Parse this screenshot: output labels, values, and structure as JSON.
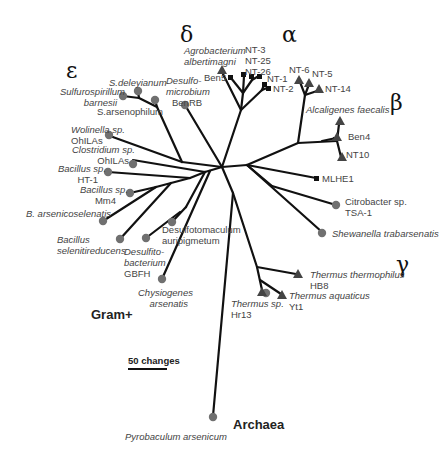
{
  "clades": {
    "epsilon": "ε",
    "delta": "δ",
    "alpha": "α",
    "beta": "β",
    "gamma": "γ"
  },
  "groups": {
    "gram_positive": "Gram+",
    "archaea": "Archaea"
  },
  "scale": {
    "label": "50 changes"
  },
  "colors": {
    "branch": "#111111",
    "circle_marker": "#707070",
    "triangle_marker": "#444444",
    "square_marker": "#111111"
  },
  "taxa": {
    "s_deleyianum": {
      "line1": "S.deleyianum",
      "marker": "circle"
    },
    "sulfurospirillum_barnesii": {
      "line1": "Sulfurospirillum",
      "line2": "barnesii",
      "marker": "circle"
    },
    "s_arsenophilum": {
      "line1": "S.arsenophilum",
      "marker": "circle"
    },
    "desulfomicrobium": {
      "line1": "Desulfo-",
      "line2": "microbium",
      "line3": "BenRB",
      "marker": "circle"
    },
    "agrobacterium": {
      "line1": "Agrobacterium",
      "line2": "albertimagni",
      "marker": "triangle"
    },
    "ben5": {
      "line1": "Ben5",
      "marker": "square"
    },
    "nt3_25_26": {
      "line1": "NT-3",
      "line2": "NT-25",
      "line3": "NT-26",
      "marker": "square"
    },
    "nt1": {
      "line1": "NT-1",
      "marker": "square"
    },
    "nt2": {
      "line1": "NT-2",
      "marker": "square"
    },
    "nt6": {
      "line1": "NT-6",
      "marker": "triangle"
    },
    "nt5": {
      "line1": "NT-5",
      "marker": "triangle"
    },
    "nt14": {
      "line1": "NT-14",
      "marker": "triangle"
    },
    "alcaligenes": {
      "line1": "Alcaligenes faecalis",
      "marker": "triangle"
    },
    "ben4": {
      "line1": "Ben4",
      "marker": "triangle"
    },
    "nt10": {
      "line1": "NT10",
      "marker": "triangle"
    },
    "mlhe1": {
      "line1": "MLHE1",
      "marker": "square"
    },
    "citrobacter": {
      "line1": "Citrobacter sp.",
      "line2": "TSA-1",
      "marker": "circle"
    },
    "shewanella": {
      "line1": "Shewanella trabarsenatis",
      "marker": "circle"
    },
    "thermus_thermophilus": {
      "line1": "Thermus thermophilus",
      "line2": "HB8",
      "marker": "triangle"
    },
    "thermus_aquaticus": {
      "line1": "Thermus aquaticus",
      "line2": "Yt1",
      "marker": "triangle"
    },
    "thermus_hr13": {
      "line1": "Thermus sp.",
      "line2": "Hr13",
      "marker": "triangle+circle"
    },
    "wolinella": {
      "line1": "Wolinella sp.",
      "line2": "OhILAs",
      "marker": "circle"
    },
    "clostridium": {
      "line1": "Clostridium sp.",
      "line2": "OhILAs",
      "marker": "circle"
    },
    "bacillus_ht1": {
      "line1": "Bacillus sp.",
      "line2": "HT-1",
      "marker": "circle"
    },
    "bacillus_mm4": {
      "line1": "Bacillus sp.",
      "line2": "Mm4",
      "marker": "circle"
    },
    "b_arsenicoselenatis": {
      "line1": "B. arsenicoselenatis",
      "marker": "circle"
    },
    "bacillus_selenitireducens": {
      "line1": "Bacillus",
      "line2": "selenitireducens",
      "marker": "circle"
    },
    "desulfitobacterium": {
      "line1": "Desulfito-",
      "line2": "bacterium",
      "line3": "GBFH",
      "marker": "circle"
    },
    "desulfotomaculum": {
      "line1": "Desulfotomaculum",
      "line2": "auripigmetum",
      "marker": "circle"
    },
    "chrysiogenes": {
      "line1": "Chysiogenes",
      "line2": "arsenatis",
      "marker": "circle"
    },
    "pyrobaculum": {
      "line1": "Pyrobaculum arsenicum",
      "marker": "circle"
    }
  }
}
